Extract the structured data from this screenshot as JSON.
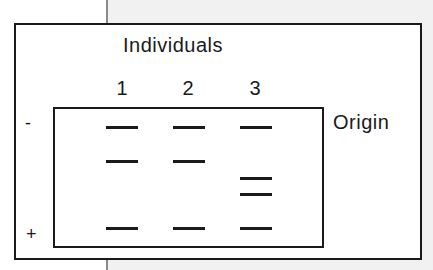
{
  "diagram": {
    "title": "Individuals",
    "lanes": [
      {
        "label": "1",
        "bands": [
          "row1",
          "row2",
          "row5"
        ]
      },
      {
        "label": "2",
        "bands": [
          "row1",
          "row2",
          "row5"
        ]
      },
      {
        "label": "3",
        "bands": [
          "row1",
          "row3",
          "row4",
          "row5"
        ]
      }
    ],
    "origin_label": "Origin",
    "negative_pole": "-",
    "positive_pole": "+"
  },
  "colors": {
    "ink": "#1a1a1a",
    "background": "#ffffff",
    "page_gray": "#f1f1f1"
  }
}
